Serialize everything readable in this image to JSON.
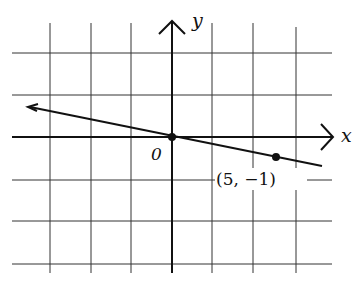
{
  "figure": {
    "x_axis_label": "x",
    "y_axis_label": "y",
    "origin_label": "0",
    "point_label": "(5, −1)",
    "point": {
      "x": 5,
      "y": -1
    },
    "line": {
      "slope": -0.2,
      "intercept": 0,
      "equation": "y = -x/5",
      "passes_through": [
        "(0, 0)",
        "(5, -1)"
      ]
    },
    "grid": {
      "vertical_lines": 7,
      "horizontal_lines": 6
    },
    "colors": {
      "ink": "#111111",
      "grid": "#333333",
      "background": "#ffffff"
    }
  }
}
